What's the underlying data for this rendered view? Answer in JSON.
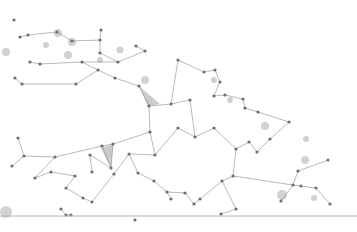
{
  "image": {
    "description": "Abstract grey plexus network of connected dots forming a dome shape on a white background with a horizontal baseline",
    "background_color": "#ffffff",
    "node_color": "#6e6e6e",
    "edge_color": "#8a8a8a",
    "baseline_y": 216
  },
  "nodes": [
    [
      14,
      20
    ],
    [
      20,
      37
    ],
    [
      28,
      35
    ],
    [
      57,
      32
    ],
    [
      72,
      41
    ],
    [
      101,
      30
    ],
    [
      100,
      40
    ],
    [
      136,
      46
    ],
    [
      145,
      51
    ],
    [
      100,
      53
    ],
    [
      118,
      62
    ],
    [
      30,
      62
    ],
    [
      40,
      64
    ],
    [
      82,
      62
    ],
    [
      98,
      70
    ],
    [
      115,
      78
    ],
    [
      76,
      84
    ],
    [
      22,
      84
    ],
    [
      15,
      78
    ],
    [
      139,
      86
    ],
    [
      149,
      106
    ],
    [
      171,
      104
    ],
    [
      178,
      60
    ],
    [
      204,
      72
    ],
    [
      215,
      70
    ],
    [
      220,
      82
    ],
    [
      214,
      96
    ],
    [
      225,
      95
    ],
    [
      243,
      99
    ],
    [
      245,
      108
    ],
    [
      258,
      112
    ],
    [
      190,
      100
    ],
    [
      195,
      137
    ],
    [
      214,
      128
    ],
    [
      150,
      132
    ],
    [
      155,
      155
    ],
    [
      178,
      128
    ],
    [
      113,
      144
    ],
    [
      111,
      168
    ],
    [
      90,
      155
    ],
    [
      92,
      172
    ],
    [
      55,
      157
    ],
    [
      24,
      156
    ],
    [
      18,
      138
    ],
    [
      12,
      166
    ],
    [
      35,
      178
    ],
    [
      51,
      172
    ],
    [
      75,
      176
    ],
    [
      66,
      188
    ],
    [
      83,
      198
    ],
    [
      92,
      202
    ],
    [
      114,
      174
    ],
    [
      129,
      154
    ],
    [
      138,
      173
    ],
    [
      154,
      181
    ],
    [
      167,
      192
    ],
    [
      171,
      199
    ],
    [
      185,
      193
    ],
    [
      194,
      204
    ],
    [
      200,
      199
    ],
    [
      222,
      181
    ],
    [
      233,
      176
    ],
    [
      236,
      149
    ],
    [
      249,
      142
    ],
    [
      257,
      152
    ],
    [
      270,
      139
    ],
    [
      289,
      122
    ],
    [
      293,
      185
    ],
    [
      281,
      201
    ],
    [
      301,
      186
    ],
    [
      316,
      188
    ],
    [
      330,
      204
    ],
    [
      328,
      160
    ],
    [
      298,
      171
    ],
    [
      236,
      209
    ],
    [
      221,
      214
    ],
    [
      61,
      209
    ],
    [
      66,
      215
    ],
    [
      71,
      215
    ],
    [
      102,
      146
    ],
    [
      135,
      220
    ]
  ],
  "edges": [
    [
      1,
      2
    ],
    [
      2,
      3
    ],
    [
      3,
      4
    ],
    [
      4,
      6
    ],
    [
      5,
      6
    ],
    [
      6,
      9
    ],
    [
      9,
      10
    ],
    [
      7,
      8
    ],
    [
      8,
      10
    ],
    [
      10,
      13
    ],
    [
      11,
      12
    ],
    [
      12,
      13
    ],
    [
      13,
      14
    ],
    [
      14,
      15
    ],
    [
      15,
      19
    ],
    [
      16,
      17
    ],
    [
      17,
      18
    ],
    [
      14,
      16
    ],
    [
      19,
      20
    ],
    [
      20,
      21
    ],
    [
      21,
      22
    ],
    [
      22,
      23
    ],
    [
      23,
      24
    ],
    [
      24,
      25
    ],
    [
      25,
      26
    ],
    [
      26,
      27
    ],
    [
      27,
      28
    ],
    [
      28,
      29
    ],
    [
      29,
      30
    ],
    [
      21,
      31
    ],
    [
      31,
      32
    ],
    [
      32,
      33
    ],
    [
      20,
      34
    ],
    [
      34,
      35
    ],
    [
      35,
      36
    ],
    [
      36,
      32
    ],
    [
      34,
      37
    ],
    [
      37,
      38
    ],
    [
      38,
      39
    ],
    [
      39,
      40
    ],
    [
      41,
      42
    ],
    [
      42,
      43
    ],
    [
      42,
      44
    ],
    [
      41,
      45
    ],
    [
      45,
      46
    ],
    [
      46,
      47
    ],
    [
      47,
      48
    ],
    [
      48,
      49
    ],
    [
      49,
      50
    ],
    [
      50,
      51
    ],
    [
      51,
      52
    ],
    [
      52,
      35
    ],
    [
      52,
      53
    ],
    [
      53,
      54
    ],
    [
      54,
      55
    ],
    [
      55,
      56
    ],
    [
      55,
      57
    ],
    [
      57,
      58
    ],
    [
      58,
      59
    ],
    [
      59,
      60
    ],
    [
      60,
      61
    ],
    [
      61,
      62
    ],
    [
      62,
      63
    ],
    [
      63,
      64
    ],
    [
      64,
      65
    ],
    [
      65,
      66
    ],
    [
      61,
      67
    ],
    [
      67,
      68
    ],
    [
      67,
      69
    ],
    [
      69,
      70
    ],
    [
      70,
      71
    ],
    [
      72,
      73
    ],
    [
      73,
      67
    ],
    [
      60,
      74
    ],
    [
      74,
      75
    ],
    [
      76,
      77
    ],
    [
      77,
      78
    ],
    [
      38,
      79
    ],
    [
      79,
      41
    ],
    [
      37,
      79
    ],
    [
      33,
      62
    ],
    [
      30,
      66
    ]
  ],
  "triangles": [
    [
      [
        101,
        148
      ],
      [
        113,
        144
      ],
      [
        111,
        168
      ]
    ],
    [
      [
        148,
        106
      ],
      [
        139,
        86
      ],
      [
        160,
        104
      ]
    ]
  ]
}
